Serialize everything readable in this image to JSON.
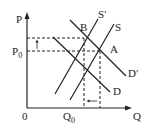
{
  "diagram": {
    "axes": {
      "y_label": "P",
      "x_label": "Q",
      "origin": "0"
    },
    "labels": {
      "price_p0": "P",
      "price_p0_sub": "0",
      "quantity_q0": "Q",
      "quantity_q0_sub": "0",
      "point_a": "A",
      "point_b": "B",
      "supply": "S",
      "supply_shifted": "S",
      "supply_shifted_prime": "′",
      "demand": "D",
      "demand_shifted": "D",
      "demand_shifted_prime": "′"
    },
    "colors": {
      "line": "#222222",
      "background": "#ffffff"
    }
  }
}
